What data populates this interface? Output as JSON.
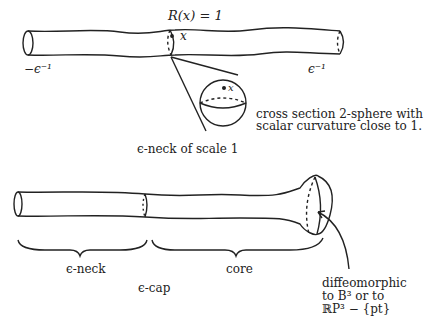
{
  "top_diagram": {
    "curvature_label": "R(x) = 1",
    "point_label": "x",
    "left_end_label": "−ϵ⁻¹",
    "right_end_label": "ϵ⁻¹",
    "sphere_point_label": "x",
    "cross_section_line1": "cross section 2-sphere with",
    "cross_section_line2": "scalar curvature close to 1.",
    "caption": "ϵ-neck of scale 1"
  },
  "bottom_diagram": {
    "neck_label": "ϵ-neck",
    "core_label": "core",
    "cap_label": "ϵ-cap",
    "diffeo_line1": "diffeomorphic",
    "diffeo_line2": "to B³ or to",
    "diffeo_line3": "ℝP³ − {pt}"
  },
  "colors": {
    "stroke": "#222222",
    "background": "#ffffff"
  }
}
